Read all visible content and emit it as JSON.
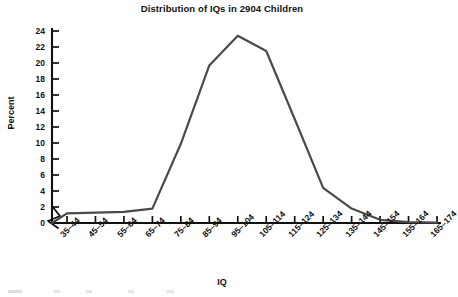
{
  "chart_data": {
    "type": "line",
    "title": "Distribution of IQs in 2904 Children",
    "xlabel": "IQ",
    "ylabel": "Percent",
    "categories": [
      "35–44",
      "45–54",
      "55–64",
      "65–74",
      "75–84",
      "85–94",
      "95–104",
      "105–114",
      "115–124",
      "125–134",
      "135–144",
      "145–154",
      "155–164",
      "165–174"
    ],
    "values": [
      1.2,
      1.3,
      1.4,
      1.8,
      9.9,
      19.7,
      23.4,
      21.5,
      13.0,
      4.4,
      1.8,
      0.4,
      0.1,
      0.05
    ],
    "series": [
      {
        "name": "Percent of children",
        "values": [
          1.2,
          1.3,
          1.4,
          1.8,
          9.9,
          19.7,
          23.4,
          21.5,
          13.0,
          4.4,
          1.8,
          0.4,
          0.1,
          0.05
        ]
      }
    ],
    "ylim": [
      0,
      24
    ],
    "yticks": [
      0,
      2,
      4,
      6,
      8,
      10,
      12,
      14,
      16,
      18,
      20,
      22,
      24
    ],
    "ytick_labels": [
      "0",
      "2",
      "4",
      "6",
      "8",
      "10",
      "12",
      "14",
      "16",
      "18",
      "20",
      "22",
      "24"
    ],
    "grid": false,
    "legend": "none",
    "axis_break": "y-axis break at origin",
    "line_color": "#4a4a4a",
    "axis_color": "#111111"
  },
  "axes": {
    "y_title": "Percent",
    "x_title": "IQ"
  },
  "header": {
    "title": "Distribution of IQs in 2904 Children"
  }
}
